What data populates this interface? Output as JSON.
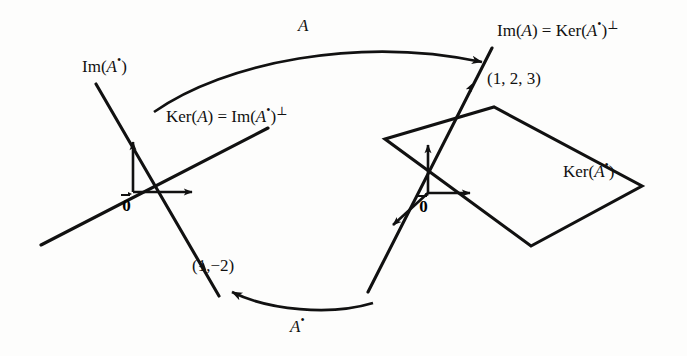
{
  "figure": {
    "type": "diagram",
    "background_color": "#fdfdfc",
    "ink_color": "#111111",
    "width": 687,
    "height": 356
  },
  "labels": {
    "im_a_star": {
      "text": "Im(A•)",
      "parts": {
        "prefix": "Im(",
        "operator": "A",
        "adjoint": "•",
        "suffix": ")"
      },
      "x": 82,
      "y": 58
    },
    "ker_a_eq_im_a_star_perp": {
      "text": "Ker(A) = Im(A•)⊥",
      "parts": {
        "left_prefix": "Ker(",
        "left_op": "A",
        "left_suffix": ")",
        "equals": " = ",
        "right_prefix": "Im(",
        "right_op": "A",
        "right_adjoint": "•",
        "right_suffix": ")",
        "right_perp": "⊥"
      },
      "x": 166,
      "y": 108
    },
    "im_a_eq_ker_a_star_perp": {
      "text": "Im(A) = Ker(A•)⊥",
      "parts": {
        "left_prefix": "Im(",
        "left_op": "A",
        "left_suffix": ")",
        "equals": " = ",
        "right_prefix": "Ker(",
        "right_op": "A",
        "right_adjoint": "•",
        "right_suffix": ")",
        "right_perp": "⊥"
      },
      "x": 497,
      "y": 22
    },
    "ker_a_star": {
      "text": "Ker(A•)",
      "parts": {
        "prefix": "Ker(",
        "operator": "A",
        "adjoint": "•",
        "suffix": ")"
      },
      "x": 563,
      "y": 163
    },
    "point_1_2_3": {
      "text": "(1, 2, 3)",
      "x": 487,
      "y": 70
    },
    "point_1_minus_2": {
      "text": "(1,−2)",
      "x": 192,
      "y": 257
    },
    "map_a": {
      "text": "A",
      "x": 298,
      "y": 17
    },
    "map_a_star": {
      "text": "A•",
      "parts": {
        "operator": "A",
        "adjoint": "•"
      },
      "x": 290,
      "y": 318
    },
    "origin_left": {
      "text": "0",
      "x": 123,
      "y": 196
    },
    "origin_right": {
      "text": "0",
      "x": 420,
      "y": 197
    }
  },
  "geometry": {
    "domain_space": {
      "name": "left-2d-space",
      "origin": [
        133,
        192
      ],
      "axes": [
        {
          "name": "vertical-axis-arrow",
          "from": [
            133,
            192
          ],
          "to": [
            133,
            135
          ]
        },
        {
          "name": "horizontal-axis-arrow",
          "from": [
            133,
            192
          ],
          "to": [
            199,
            192
          ]
        }
      ],
      "subspace_lines": [
        {
          "name": "im-a-star-line",
          "from": [
            96,
            84
          ],
          "to": [
            219,
            296
          ]
        },
        {
          "name": "ker-a-line",
          "from": [
            41,
            245
          ],
          "to": [
            268,
            128
          ]
        }
      ],
      "vector_arrow": {
        "name": "vector-1-minus-2",
        "from": [
          133,
          192
        ],
        "to": [
          207,
          270
        ]
      }
    },
    "codomain_space": {
      "name": "right-3d-space",
      "origin": [
        428,
        193
      ],
      "axes": [
        {
          "name": "vertical-axis-arrow",
          "from": [
            428,
            193
          ],
          "to": [
            428,
            138
          ]
        },
        {
          "name": "horizontal-axis-arrow",
          "from": [
            428,
            193
          ],
          "to": [
            477,
            193
          ]
        },
        {
          "name": "depth-axis-arrow",
          "from": [
            428,
            193
          ],
          "to": [
            388,
            230
          ]
        }
      ],
      "subspace_lines": [
        {
          "name": "im-a-line",
          "from": [
            492,
            48
          ],
          "to": [
            368,
            292
          ]
        }
      ],
      "vector_arrow": {
        "name": "vector-1-2-3",
        "from": [
          428,
          193
        ],
        "to": [
          472,
          80
        ]
      },
      "plane": {
        "name": "ker-a-star-plane",
        "vertices": [
          [
            385,
            139
          ],
          [
            494,
            107
          ],
          [
            642,
            186
          ],
          [
            531,
            246
          ]
        ]
      }
    },
    "maps": [
      {
        "name": "forward-map-arrow",
        "label": "A",
        "from": [
          154,
          112
        ],
        "control": [
          330,
          40
        ],
        "to": [
          489,
          63
        ]
      },
      {
        "name": "adjoint-map-arrow",
        "label": "A•",
        "from": [
          373,
          303
        ],
        "control": [
          300,
          320
        ],
        "to": [
          224,
          291
        ]
      }
    ]
  }
}
